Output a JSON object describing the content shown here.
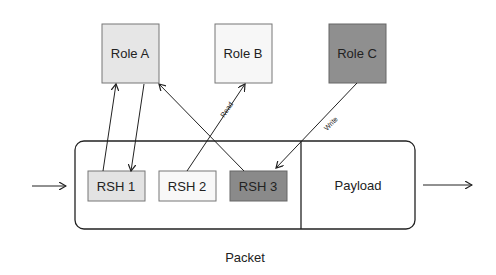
{
  "roles": [
    {
      "label": "Role A",
      "fill": "#e6e6e6"
    },
    {
      "label": "Role B",
      "fill": "#f7f7f7"
    },
    {
      "label": "Role C",
      "fill": "#8f8f8f"
    }
  ],
  "headers": [
    {
      "label": "RSH 1",
      "fill": "#e3e3e3"
    },
    {
      "label": "RSH 2",
      "fill": "#f8f8f8"
    },
    {
      "label": "RSH 3",
      "fill": "#8a8a8a"
    }
  ],
  "payload": {
    "label": "Payload"
  },
  "packet": {
    "label": "Packet"
  },
  "edges": {
    "read": "Read",
    "write": "Write"
  }
}
